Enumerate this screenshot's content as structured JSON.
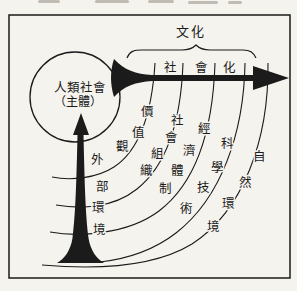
{
  "figure": {
    "culture_label": "文化",
    "socialization_label": "社會化",
    "subject_circle": {
      "line1": "人類社會",
      "line2": "（主體）"
    },
    "bands": [
      {
        "name": "values",
        "label": "價值觀"
      },
      {
        "name": "social-organization",
        "label": "社會組織"
      },
      {
        "name": "economic-system",
        "label": "經濟體制"
      },
      {
        "name": "science-technology",
        "label": "科學技術"
      },
      {
        "name": "natural-environment",
        "label": "自然環境"
      }
    ],
    "external_environment_label": "外部環境",
    "icons": {
      "horizontal_arrow": "right-arrow",
      "vertical_arrow": "up-arrow",
      "brace": "horizontal-curly-brace"
    },
    "colors": {
      "ink": "#1b1b1b",
      "paper": "#f5f3ee"
    }
  }
}
